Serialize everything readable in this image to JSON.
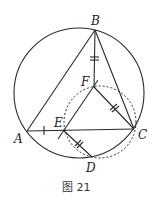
{
  "figure": {
    "caption": "图 21",
    "points": {
      "A": {
        "label": "A",
        "x": 27,
        "y": 131
      },
      "B": {
        "label": "B",
        "x": 95,
        "y": 30
      },
      "C": {
        "label": "C",
        "x": 134,
        "y": 129
      },
      "D": {
        "label": "D",
        "x": 92,
        "y": 157
      },
      "E": {
        "label": "E",
        "x": 63,
        "y": 130
      },
      "F": {
        "label": "F",
        "x": 94,
        "y": 87
      }
    },
    "circles": {
      "circumcircle": {
        "cx": 79,
        "cy": 93,
        "r": 65,
        "style": "solid"
      },
      "small_circle": {
        "cx": 100,
        "cy": 122,
        "r": 36,
        "style": "dashed"
      }
    },
    "segments": [
      "AB",
      "BC",
      "AC",
      "BF",
      "FC",
      "EF",
      "ED",
      "DC"
    ],
    "equal_marks": {
      "single": [
        "AE",
        "EF-extension"
      ],
      "double": [
        "BF",
        "FC",
        "ED"
      ]
    },
    "colors": {
      "stroke": "#2a2a2a",
      "background": "#ffffff"
    }
  }
}
